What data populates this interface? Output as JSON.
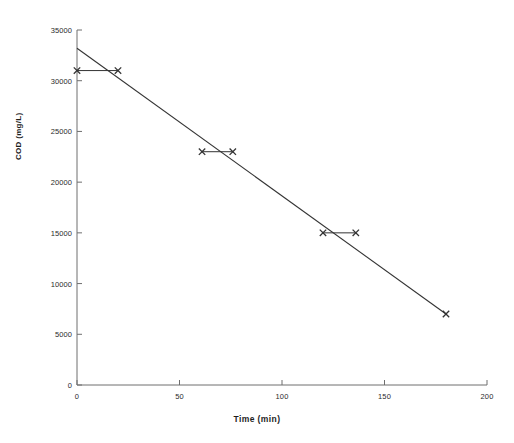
{
  "chart_data": {
    "type": "scatter",
    "title": "",
    "subtitle": "",
    "xlabel": "Time (min)",
    "ylabel": "COD (mg/L)",
    "xlim": [
      0,
      200
    ],
    "ylim": [
      0,
      35000
    ],
    "xticks": [
      0,
      50,
      100,
      150,
      200
    ],
    "xtick_labels": [
      "0",
      "50",
      "100",
      "150",
      "200"
    ],
    "yticks": [
      0,
      5000,
      10000,
      15000,
      20000,
      25000,
      30000,
      35000
    ],
    "ytick_labels": [
      "0",
      "5000",
      "10000",
      "15000",
      "20000",
      "25000",
      "30000",
      "35000"
    ],
    "grid": false,
    "legend": "none",
    "marker": "x",
    "marker_color": "#333333",
    "line_color": "#333333",
    "points": [
      {
        "x": 0,
        "y": 31000
      },
      {
        "x": 20,
        "y": 31000
      },
      {
        "x": 61,
        "y": 23000
      },
      {
        "x": 76,
        "y": 23000
      },
      {
        "x": 120,
        "y": 15000
      },
      {
        "x": 136,
        "y": 15000
      },
      {
        "x": 180,
        "y": 7000
      }
    ],
    "connectors": [
      {
        "x1": 0,
        "y1": 31000,
        "x2": 20,
        "y2": 31000
      },
      {
        "x1": 61,
        "y1": 23000,
        "x2": 76,
        "y2": 23000
      },
      {
        "x1": 120,
        "y1": 15000,
        "x2": 136,
        "y2": 15000
      }
    ],
    "trendline": {
      "x1": 0,
      "y1": 33200,
      "x2": 180,
      "y2": 7000
    }
  },
  "axes": {
    "x_title": "Time (min)",
    "y_title": "COD (mg/L)"
  }
}
